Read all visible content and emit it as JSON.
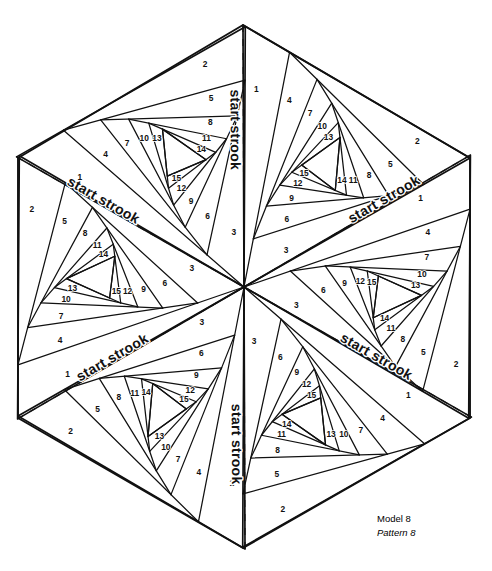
{
  "page": {
    "background_color": "#ffffff",
    "line_color": "#111111",
    "caption_color": "#4a4a4a"
  },
  "caption": {
    "model": "Model 8",
    "pattern": "Pattern 8"
  },
  "labels": {
    "start_strook": "start strook"
  },
  "figure": {
    "shape": "hexagon",
    "wedge_count": 6,
    "strips_per_wedge": 15,
    "center": {
      "x": 244,
      "y": 287
    },
    "vertices": [
      {
        "x": 243,
        "y": 25
      },
      {
        "x": 470,
        "y": 158
      },
      {
        "x": 470,
        "y": 418
      },
      {
        "x": 243,
        "y": 548
      },
      {
        "x": 18,
        "y": 418
      },
      {
        "x": 18,
        "y": 158
      }
    ],
    "strip_numbers": [
      1,
      2,
      3,
      4,
      5,
      6,
      7,
      8,
      9,
      10,
      11,
      12,
      13,
      14,
      15
    ],
    "wedges": [
      {
        "name": "wedge-top-right",
        "rotation": 0,
        "start_strook_label": "start strook"
      },
      {
        "name": "wedge-right",
        "rotation": 60,
        "start_strook_label": "start strook"
      },
      {
        "name": "wedge-bottom-right",
        "rotation": 120,
        "start_strook_label": "start strook"
      },
      {
        "name": "wedge-bottom-left",
        "rotation": 180,
        "start_strook_label": "start strook"
      },
      {
        "name": "wedge-left",
        "rotation": 240,
        "start_strook_label": "start strook"
      },
      {
        "name": "wedge-top-left",
        "rotation": 300,
        "start_strook_label": "start strook"
      }
    ]
  }
}
